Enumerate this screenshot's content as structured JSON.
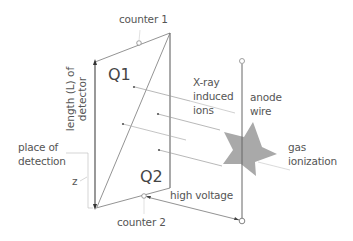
{
  "diagram": {
    "labels": {
      "counter1": "counter 1",
      "counter2": "counter 2",
      "q1": "Q1",
      "q2": "Q2",
      "length_line1": "length (L) of",
      "length_line2": "detector",
      "xray_line1": "X-ray",
      "xray_line2": "induced",
      "xray_line3": "ions",
      "anode_line1": "anode",
      "anode_line2": "wire",
      "gas_line1": "gas",
      "gas_line2": "ionization",
      "place_line1": "place of",
      "place_line2": "detection",
      "z": "z",
      "high_voltage": "high voltage"
    },
    "colors": {
      "line": "#555555",
      "light_line": "#bbbbbb",
      "star_fill": "#a9a9a9",
      "text": "#555555"
    }
  }
}
